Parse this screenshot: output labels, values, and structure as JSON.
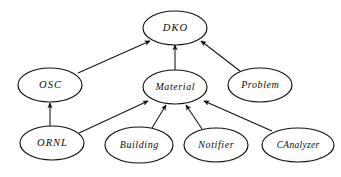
{
  "diagram": {
    "type": "class-hierarchy-graph",
    "background_color": "#ffffff",
    "stroke_color": "#111111",
    "text_color": "#0d0d0d",
    "node_shape": "ellipse",
    "edge_style": "straight-line-with-arrowhead",
    "edge_direction": "child-points-to-parent",
    "nodes": [
      {
        "id": "dko",
        "label": "DKO",
        "cx": 175,
        "cy": 28,
        "rx": 32,
        "ry": 17,
        "font_size": 10.5,
        "letter_spacing": 1.1
      },
      {
        "id": "osc",
        "label": "OSC",
        "cx": 50,
        "cy": 85,
        "rx": 32,
        "ry": 17,
        "font_size": 10.5,
        "letter_spacing": 1.1
      },
      {
        "id": "material",
        "label": "Material",
        "cx": 175,
        "cy": 87,
        "rx": 32,
        "ry": 17,
        "font_size": 10,
        "letter_spacing": 0.6
      },
      {
        "id": "problem",
        "label": "Problem",
        "cx": 260,
        "cy": 85,
        "rx": 32,
        "ry": 17,
        "font_size": 10,
        "letter_spacing": 0.6
      },
      {
        "id": "ornl",
        "label": "ORNL",
        "cx": 52,
        "cy": 143,
        "rx": 32,
        "ry": 17,
        "font_size": 10.5,
        "letter_spacing": 1.0
      },
      {
        "id": "building",
        "label": "Building",
        "cx": 139,
        "cy": 145,
        "rx": 34,
        "ry": 18,
        "font_size": 10,
        "letter_spacing": 0.6
      },
      {
        "id": "notifier",
        "label": "Notifier",
        "cx": 216,
        "cy": 145,
        "rx": 32,
        "ry": 17,
        "font_size": 10,
        "letter_spacing": 0.6
      },
      {
        "id": "canalyzer",
        "label": "CAnalyzer",
        "cx": 298,
        "cy": 145,
        "rx": 36,
        "ry": 17,
        "font_size": 9.5,
        "letter_spacing": 0.3
      }
    ],
    "edges": [
      {
        "id": "osc-to-dko",
        "from": "osc",
        "to": "dko",
        "x1": 78,
        "y1": 73,
        "x2": 150,
        "y2": 41
      },
      {
        "id": "material-to-dko",
        "from": "material",
        "to": "dko",
        "x1": 175,
        "y1": 70,
        "x2": 175,
        "y2": 45
      },
      {
        "id": "problem-to-dko",
        "from": "problem",
        "to": "dko",
        "x1": 240,
        "y1": 71,
        "x2": 201,
        "y2": 41
      },
      {
        "id": "ornl-to-osc",
        "from": "ornl",
        "to": "osc",
        "x1": 50,
        "y1": 126,
        "x2": 50,
        "y2": 103
      },
      {
        "id": "ornl-to-material",
        "from": "ornl",
        "to": "material",
        "x1": 79,
        "y1": 133,
        "x2": 148,
        "y2": 101
      },
      {
        "id": "building-to-material",
        "from": "building",
        "to": "material",
        "x1": 152,
        "y1": 128,
        "x2": 166,
        "y2": 105
      },
      {
        "id": "notifier-to-material",
        "from": "notifier",
        "to": "material",
        "x1": 202,
        "y1": 129,
        "x2": 186,
        "y2": 105
      },
      {
        "id": "canalyzer-to-material",
        "from": "canalyzer",
        "to": "material",
        "x1": 272,
        "y1": 131,
        "x2": 204,
        "y2": 101
      }
    ]
  }
}
